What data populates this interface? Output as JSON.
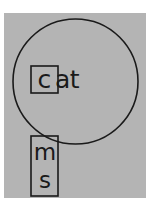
{
  "figure": {
    "title": "",
    "background_color": "#ffffff",
    "panel_color": "#b4b4b4",
    "stroke_color": "#1a1a1a"
  },
  "circle": {
    "name": "large-circle",
    "cx": 75.5,
    "cy": 81.5,
    "r": 62.5,
    "fill": "none",
    "stroke": "#1a1a1a",
    "stroke_width": 1.6
  },
  "word": {
    "full_text": "cat",
    "boxed_letter": "c",
    "remaining_letters": "at",
    "box": {
      "x": 31,
      "y": 66,
      "width": 27,
      "height": 27,
      "stroke": "#1a1a1a",
      "stroke_width": 1.6
    }
  },
  "vertical_box": {
    "name": "vertical-rectangle",
    "x": 31,
    "y": 136,
    "width": 27,
    "height": 60,
    "stroke": "#1a1a1a",
    "stroke_width": 1.6,
    "letters": [
      {
        "text": "m"
      },
      {
        "text": "s"
      }
    ]
  },
  "labels": {
    "letter_m": "m",
    "letter_s": "s",
    "letter_c": "c",
    "letters_at": "at"
  }
}
